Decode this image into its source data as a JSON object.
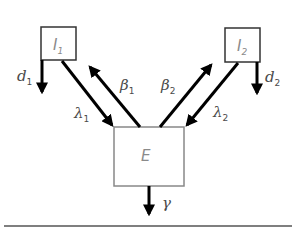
{
  "nodes": {
    "I1": {
      "symbol": "I",
      "subscript": "1"
    },
    "I2": {
      "symbol": "I",
      "subscript": "2"
    },
    "E": {
      "symbol": "E"
    }
  },
  "edges": {
    "d1": {
      "symbol": "d",
      "subscript": "1",
      "from": "I1",
      "to": "out"
    },
    "d2": {
      "symbol": "d",
      "subscript": "2",
      "from": "I2",
      "to": "out"
    },
    "lambda1": {
      "symbol": "λ",
      "subscript": "1",
      "from": "I1",
      "to": "E"
    },
    "beta1": {
      "symbol": "β",
      "subscript": "1",
      "from": "E",
      "to": "I1"
    },
    "beta2": {
      "symbol": "β",
      "subscript": "2",
      "from": "E",
      "to": "I2"
    },
    "lambda2": {
      "symbol": "λ",
      "subscript": "2",
      "from": "I2",
      "to": "E"
    },
    "gamma": {
      "symbol": "γ",
      "from": "E",
      "to": "out"
    }
  },
  "colors": {
    "arrow": "#000000",
    "box_border_I": "#333333",
    "box_border_E": "#888888",
    "label": "#4a4a4a",
    "divider": "#555555"
  }
}
